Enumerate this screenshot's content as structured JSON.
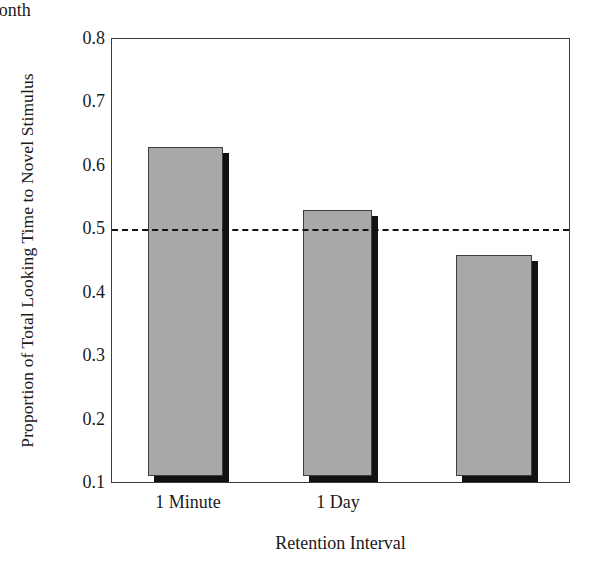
{
  "chart_data": {
    "type": "bar",
    "title": "",
    "xlabel": "Retention Interval",
    "ylabel": "Proportion of Total Looking Time to Novel Stimulus",
    "categories": [
      "1 Minute",
      "1 Day",
      "1 Month"
    ],
    "values": [
      0.62,
      0.52,
      0.45
    ],
    "ylim": [
      0.1,
      0.8
    ],
    "yticks": [
      "0.8",
      "0.7",
      "0.6",
      "0.5",
      "0.4",
      "0.3",
      "0.2",
      "0.1"
    ],
    "ytick_values": [
      0.8,
      0.7,
      0.6,
      0.5,
      0.4,
      0.3,
      0.2,
      0.1
    ],
    "grid": false,
    "legend": "none",
    "reference_line": {
      "value": 0.5,
      "style": "dashed",
      "color": "#111111",
      "label": ""
    },
    "bar_style": {
      "fill_color": "#a8a8a8",
      "edge_color": "#3d3d3d",
      "shadow_color": "#111111",
      "shadow_offset_px": 6
    },
    "axis_color": "#3b3b3b",
    "background_color": "#ffffff"
  }
}
